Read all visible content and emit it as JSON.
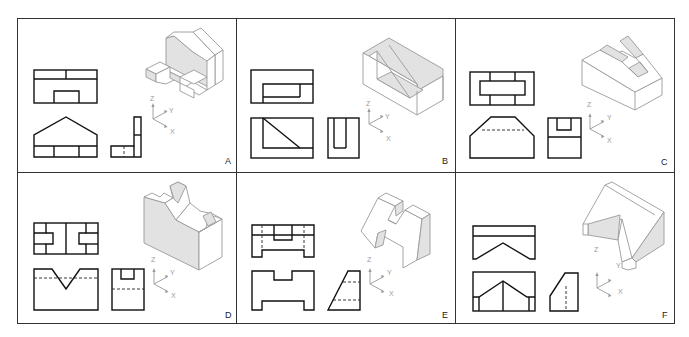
{
  "figure": {
    "layout": {
      "rows": 2,
      "columns": 3
    },
    "axis_labels": {
      "z": "Z",
      "y": "Y",
      "x": "X"
    },
    "colors": {
      "ortho_line": "#111111",
      "iso_line": "#9a9a9a",
      "iso_shade": "#e2e2e2",
      "frame": "#333333"
    },
    "panels": [
      {
        "id": "A",
        "label": "A",
        "views": [
          "top",
          "front",
          "side",
          "isometric"
        ]
      },
      {
        "id": "B",
        "label": "B",
        "views": [
          "top",
          "front",
          "side",
          "isometric"
        ]
      },
      {
        "id": "C",
        "label": "C",
        "views": [
          "top",
          "front",
          "side",
          "isometric"
        ]
      },
      {
        "id": "D",
        "label": "D",
        "views": [
          "top",
          "front",
          "side",
          "isometric"
        ]
      },
      {
        "id": "E",
        "label": "E",
        "views": [
          "top",
          "front",
          "side",
          "isometric"
        ]
      },
      {
        "id": "F",
        "label": "F",
        "views": [
          "top",
          "front",
          "side",
          "isometric"
        ]
      }
    ]
  }
}
